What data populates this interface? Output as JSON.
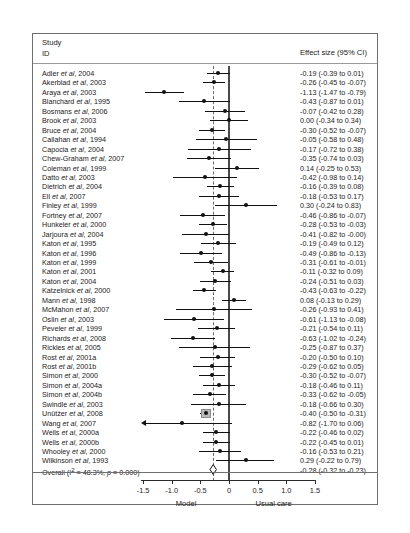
{
  "header": {
    "study_label_line1": "Study",
    "study_label_line2": "ID",
    "effect_header": "Effect size (95% CI)"
  },
  "axis": {
    "ticks": [
      -1.5,
      -1.0,
      -0.5,
      0,
      0.5,
      1.0,
      1.5
    ],
    "tick_labels": [
      "-1.5",
      "-1.0",
      "-0.5",
      "0",
      "0.5",
      "1.0",
      "1.5"
    ],
    "left_title": "Model",
    "right_title": "Usual care",
    "xmin": -1.75,
    "xmax": 1.75,
    "null_value": 0,
    "pooled_line": -0.28
  },
  "chart_data": {
    "type": "forest",
    "title": "",
    "xlabel": "",
    "ylabel": "",
    "xlim": [
      -1.75,
      1.75
    ],
    "grid": false,
    "legend": "none",
    "null_line": 0,
    "pooled_line": -0.28,
    "effect_measure": "Effect size (95% CI)",
    "left_favors": "Model",
    "right_favors": "Usual care",
    "heterogeneity": "I² = 48.3%, p = 0.000",
    "studies": [
      {
        "label": "Adler <i>et al</i>, 2004",
        "est": -0.19,
        "lo": -0.39,
        "hi": 0.01,
        "text": "-0.19 (-0.39 to 0.01)",
        "weight": 2.0
      },
      {
        "label": "Akerblad <i>et al</i>, 2003",
        "est": -0.26,
        "lo": -0.45,
        "hi": -0.07,
        "text": "-0.26 (-0.45 to -0.07)",
        "weight": 2.2
      },
      {
        "label": "Araya <i>et al</i>, 2003",
        "est": -1.13,
        "lo": -1.47,
        "hi": -0.79,
        "text": "-1.13 (-1.47 to -0.79)",
        "weight": 1.3
      },
      {
        "label": "Blanchard <i>et al</i>, 1995",
        "est": -0.43,
        "lo": -0.87,
        "hi": 0.01,
        "text": "-0.43 (-0.87 to 0.01)",
        "weight": 1.0
      },
      {
        "label": "Bosmans <i>et al</i>, 2006",
        "est": -0.07,
        "lo": -0.42,
        "hi": 0.28,
        "text": "-0.07 (-0.42 to 0.28)",
        "weight": 1.3
      },
      {
        "label": "Brook <i>et al</i>, 2003",
        "est": 0.0,
        "lo": -0.34,
        "hi": 0.34,
        "text": "0.00 (-0.34 to 0.34)",
        "weight": 1.3
      },
      {
        "label": "Bruce <i>et al</i>, 2004",
        "est": -0.3,
        "lo": -0.52,
        "hi": -0.07,
        "text": "-0.30 (-0.52 to -0.07)",
        "weight": 2.0
      },
      {
        "label": "Callahan <i>et al</i>, 1994",
        "est": -0.05,
        "lo": -0.58,
        "hi": 0.48,
        "text": "-0.05 (-0.58 to 0.48)",
        "weight": 0.8
      },
      {
        "label": "Capocia <i>et al</i>, 2004",
        "est": -0.17,
        "lo": -0.72,
        "hi": 0.38,
        "text": "-0.17 (-0.72 to 0.38)",
        "weight": 0.8
      },
      {
        "label": "Chew-Graham <i>et al</i>, 2007",
        "est": -0.35,
        "lo": -0.74,
        "hi": 0.03,
        "text": "-0.35 (-0.74 to 0.03)",
        "weight": 1.1
      },
      {
        "label": "Coleman <i>et al</i>, 1999",
        "est": 0.14,
        "lo": -0.25,
        "hi": 0.53,
        "text": "0.14 (-0.25 to 0.53)",
        "weight": 1.1
      },
      {
        "label": "Datto <i>et al</i>, 2003",
        "est": -0.42,
        "lo": -0.98,
        "hi": 0.14,
        "text": "-0.42 (-0.98 to 0.14)",
        "weight": 0.8
      },
      {
        "label": "Dietrich <i>et al</i>, 2004",
        "est": -0.16,
        "lo": -0.39,
        "hi": 0.08,
        "text": "-0.16 (-0.39 to 0.08)",
        "weight": 2.0
      },
      {
        "label": "Ell <i>et al</i>, 2007",
        "est": -0.18,
        "lo": -0.53,
        "hi": 0.17,
        "text": "-0.18 (-0.53 to 0.17)",
        "weight": 1.3
      },
      {
        "label": "Finley <i>et al</i>, 1999",
        "est": 0.3,
        "lo": -0.24,
        "hi": 0.83,
        "text": "0.30 (-0.24 to 0.83)",
        "weight": 0.8
      },
      {
        "label": "Fortney <i>et al</i>, 2007",
        "est": -0.46,
        "lo": -0.86,
        "hi": -0.07,
        "text": "-0.46 (-0.86 to -0.07)",
        "weight": 1.1
      },
      {
        "label": "Hunkeler <i>et al</i>, 2000",
        "est": -0.28,
        "lo": -0.53,
        "hi": -0.03,
        "text": "-0.28 (-0.53 to -0.03)",
        "weight": 1.8
      },
      {
        "label": "Jarjoura <i>et al</i>, 2004",
        "est": -0.41,
        "lo": -0.82,
        "hi": -0.0,
        "text": "-0.41 (-0.82 to -0.00)",
        "weight": 1.0
      },
      {
        "label": "Katon <i>et al</i>, 1995",
        "est": -0.19,
        "lo": -0.49,
        "hi": 0.12,
        "text": "-0.19 (-0.49 to 0.12)",
        "weight": 1.5
      },
      {
        "label": "Katon <i>et al</i>, 1996",
        "est": -0.49,
        "lo": -0.86,
        "hi": -0.13,
        "text": "-0.49 (-0.86 to -0.13)",
        "weight": 1.2
      },
      {
        "label": "Katon <i>et al</i>, 1999",
        "est": -0.31,
        "lo": -0.61,
        "hi": -0.01,
        "text": "-0.31 (-0.61 to -0.01)",
        "weight": 1.5
      },
      {
        "label": "Katon <i>et al</i>, 2001",
        "est": -0.11,
        "lo": -0.32,
        "hi": 0.09,
        "text": "-0.11 (-0.32 to 0.09)",
        "weight": 2.1
      },
      {
        "label": "Katon <i>et al</i>, 2004",
        "est": -0.24,
        "lo": -0.51,
        "hi": 0.03,
        "text": "-0.24 (-0.51 to 0.03)",
        "weight": 1.7
      },
      {
        "label": "Katzelnick <i>et al</i>, 2000",
        "est": -0.43,
        "lo": -0.63,
        "hi": -0.22,
        "text": "-0.43 (-0.63 to -0.22)",
        "weight": 2.1
      },
      {
        "label": "Mann <i>et al</i>, 1998",
        "est": 0.08,
        "lo": -0.13,
        "hi": 0.29,
        "text": "0.08 (-0.13 to 0.29)",
        "weight": 2.1
      },
      {
        "label": "McMahon <i>et al</i>, 2007",
        "est": -0.26,
        "lo": -0.93,
        "hi": 0.41,
        "text": "-0.26 (-0.93 to 0.41)",
        "weight": 0.6
      },
      {
        "label": "Oslin <i>et al</i>, 2003",
        "est": -0.61,
        "lo": -1.13,
        "hi": -0.08,
        "text": "-0.61 (-1.13 to -0.08)",
        "weight": 0.8
      },
      {
        "label": "Peveler <i>et al</i>, 1999",
        "est": -0.21,
        "lo": -0.54,
        "hi": 0.11,
        "text": "-0.21 (-0.54 to 0.11)",
        "weight": 1.4
      },
      {
        "label": "Richards <i>et al</i>, 2008",
        "est": -0.63,
        "lo": -1.02,
        "hi": -0.24,
        "text": "-0.63 (-1.02 to -0.24)",
        "weight": 1.1
      },
      {
        "label": "Rickles <i>et al</i>, 2005",
        "est": -0.25,
        "lo": -0.87,
        "hi": 0.37,
        "text": "-0.25 (-0.87 to 0.37)",
        "weight": 0.7
      },
      {
        "label": "Rost <i>et al</i>, 2001a",
        "est": -0.2,
        "lo": -0.5,
        "hi": 0.1,
        "text": "-0.20 (-0.50 to 0.10)",
        "weight": 1.5
      },
      {
        "label": "Rost <i>et al</i>, 2001b",
        "est": -0.29,
        "lo": -0.62,
        "hi": 0.05,
        "text": "-0.29 (-0.62 to 0.05)",
        "weight": 1.3
      },
      {
        "label": "Simon <i>et al</i>, 2000",
        "est": -0.3,
        "lo": -0.52,
        "hi": -0.07,
        "text": "-0.30 (-0.52 to -0.07)",
        "weight": 2.0
      },
      {
        "label": "Simon <i>et al</i>, 2004a",
        "est": -0.18,
        "lo": -0.46,
        "hi": 0.11,
        "text": "-0.18 (-0.46 to 0.11)",
        "weight": 1.6
      },
      {
        "label": "Simon <i>et al</i>, 2004b",
        "est": -0.33,
        "lo": -0.62,
        "hi": -0.05,
        "text": "-0.33 (-0.62 to -0.05)",
        "weight": 1.6
      },
      {
        "label": "Swindle <i>et al</i>, 2003",
        "est": -0.18,
        "lo": -0.66,
        "hi": 0.3,
        "text": "-0.18 (-0.66 to 0.30)",
        "weight": 0.9
      },
      {
        "label": "Unütżer <i>et al</i>, 2008",
        "est": -0.4,
        "lo": -0.5,
        "hi": -0.31,
        "text": "-0.40 (-0.50 to -0.31)",
        "weight": 3.2
      },
      {
        "label": "Wang <i>et al</i>, 2007",
        "est": -0.82,
        "lo": -1.7,
        "hi": 0.06,
        "text": "-0.82 (-1.70 to 0.06)",
        "weight": 0.5,
        "arrow_left": true
      },
      {
        "label": "Wells <i>et al</i>, 2000a",
        "est": -0.22,
        "lo": -0.46,
        "hi": 0.02,
        "text": "-0.22 (-0.46 to 0.02)",
        "weight": 1.9
      },
      {
        "label": "Wells <i>et al</i>, 2000b",
        "est": -0.22,
        "lo": -0.45,
        "hi": 0.01,
        "text": "-0.22 (-0.45 to 0.01)",
        "weight": 2.0
      },
      {
        "label": "Whooley <i>et al</i>, 2000",
        "est": -0.16,
        "lo": -0.53,
        "hi": 0.21,
        "text": "-0.16 (-0.53 to 0.21)",
        "weight": 1.2
      },
      {
        "label": "Wilkinson <i>et al</i>, 1993",
        "est": 0.29,
        "lo": -0.22,
        "hi": 0.79,
        "text": "0.29 (-0.22 to 0.79)",
        "weight": 0.8
      }
    ],
    "overall": {
      "label": "Overall  (I<sup>2</sup> = 48.3%, <i>p</i> = 0.000)",
      "est": -0.28,
      "lo": -0.32,
      "hi": -0.23,
      "text": "-0.28 (-0.32 to -0.23)"
    }
  }
}
